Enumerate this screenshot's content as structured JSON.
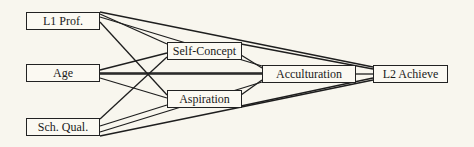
{
  "diagram": {
    "type": "path-model",
    "nodes": [
      {
        "id": "l1prof",
        "label": "L1 Prof.",
        "x": 26,
        "y": 12,
        "w": 74,
        "h": 18
      },
      {
        "id": "age",
        "label": "Age",
        "x": 26,
        "y": 64,
        "w": 74,
        "h": 18
      },
      {
        "id": "schqual",
        "label": "Sch. Qual.",
        "x": 26,
        "y": 118,
        "w": 74,
        "h": 18
      },
      {
        "id": "selfconcept",
        "label": "Self-Concept",
        "x": 167,
        "y": 42,
        "w": 75,
        "h": 18
      },
      {
        "id": "aspiration",
        "label": "Aspiration",
        "x": 167,
        "y": 90,
        "w": 75,
        "h": 18
      },
      {
        "id": "acculturation",
        "label": "Acculturation",
        "x": 262,
        "y": 65,
        "w": 94,
        "h": 18
      },
      {
        "id": "l2achieve",
        "label": "L2 Achieve",
        "x": 373,
        "y": 65,
        "w": 75,
        "h": 18
      }
    ],
    "edges": [
      [
        "l1prof",
        "selfconcept"
      ],
      [
        "l1prof",
        "aspiration"
      ],
      [
        "l1prof",
        "acculturation"
      ],
      [
        "l1prof",
        "l2achieve"
      ],
      [
        "age",
        "selfconcept"
      ],
      [
        "age",
        "aspiration"
      ],
      [
        "age",
        "acculturation"
      ],
      [
        "age",
        "l2achieve"
      ],
      [
        "schqual",
        "selfconcept"
      ],
      [
        "schqual",
        "aspiration"
      ],
      [
        "schqual",
        "acculturation"
      ],
      [
        "schqual",
        "l2achieve"
      ],
      [
        "selfconcept",
        "acculturation"
      ],
      [
        "selfconcept",
        "l2achieve"
      ],
      [
        "aspiration",
        "acculturation"
      ],
      [
        "aspiration",
        "l2achieve"
      ],
      [
        "acculturation",
        "l2achieve"
      ]
    ],
    "colors": {
      "line": "#1e1e1e",
      "background": "#f8f6ee"
    }
  }
}
